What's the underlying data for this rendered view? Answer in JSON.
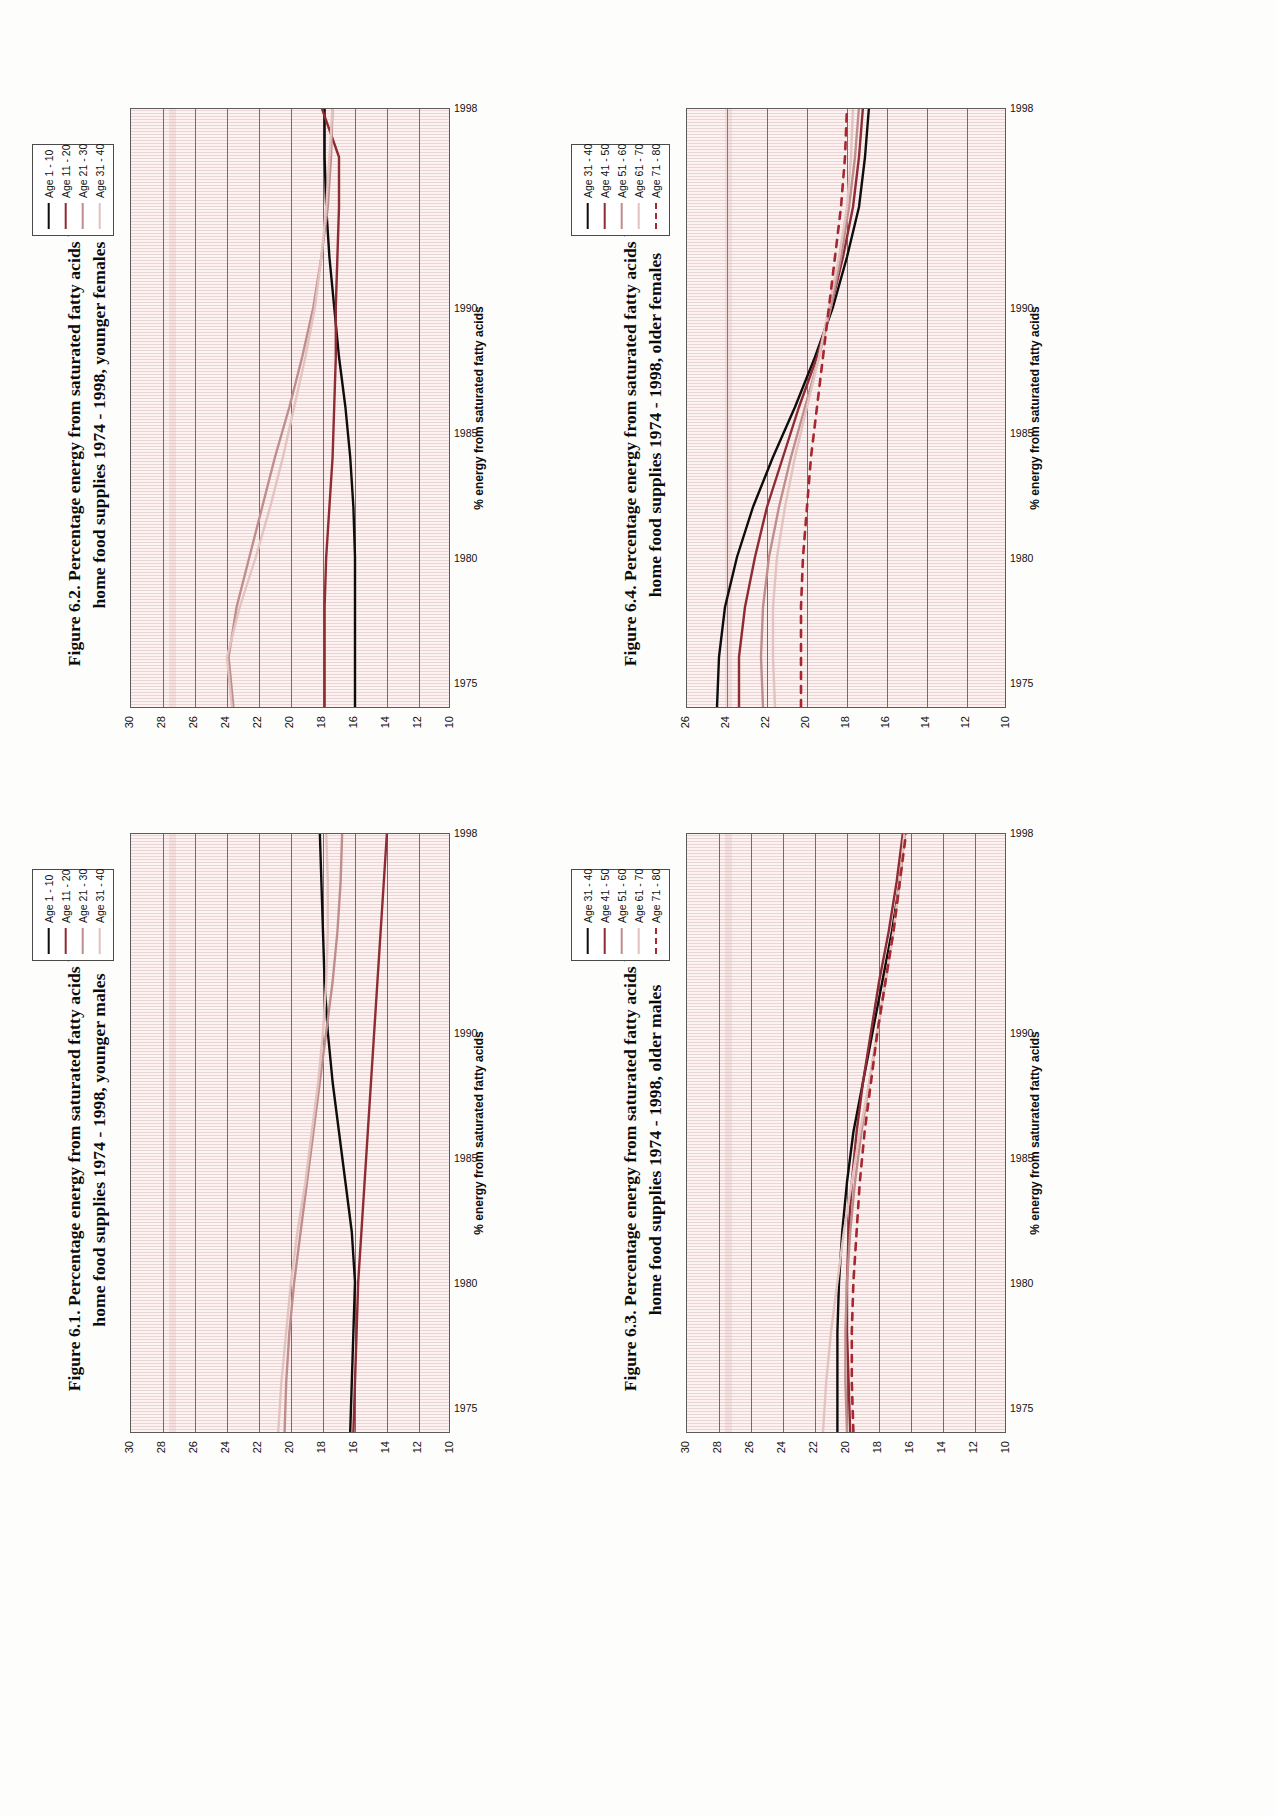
{
  "page": {
    "orientation": "landscape-rotated-90",
    "background": "#fdfdfc",
    "plot_background": "#fbf2f1"
  },
  "palette": {
    "series_1": "#0d0d0d",
    "series_2": "#8e2b33",
    "series_3": "#c08d8d",
    "series_4": "#e2c3c0",
    "series_5": "#a5272f",
    "gridline_major": "#6d6d6d",
    "gridline_minor": "#d4aaaa",
    "axis": "#5b5b5b"
  },
  "figures": [
    {
      "id": "figure-6-1",
      "title_line1": "Figure 6.1. Percentage energy from saturated fatty acids by  age,",
      "title_line2": "home food supplies 1974 - 1998, younger males",
      "chart_data": {
        "type": "line",
        "title": "Figure 6.1. Percentage energy from saturated fatty acids by age, home food supplies 1974 - 1998, younger males",
        "xlabel": "",
        "ylabel": "% energy from saturated fatty acids",
        "xlim": [
          1974,
          1998
        ],
        "ylim": [
          10,
          30
        ],
        "ytick_labels": [
          "30",
          "28",
          "26",
          "24",
          "22",
          "20",
          "18",
          "16",
          "14",
          "12",
          "10"
        ],
        "ytick_values": [
          30,
          28,
          26,
          24,
          22,
          20,
          18,
          16,
          14,
          12,
          10
        ],
        "xtick_labels": [
          "1975",
          "1980",
          "1985",
          "1990",
          "1998"
        ],
        "xtick_values": [
          1975,
          1980,
          1985,
          1990,
          1998
        ],
        "grid": true,
        "legend_position": "top-right",
        "x": [
          1974,
          1976,
          1978,
          1980,
          1982,
          1984,
          1986,
          1988,
          1990,
          1992,
          1994,
          1996,
          1998
        ],
        "series": [
          {
            "name": "Age 1 - 10",
            "color": "#0d0d0d",
            "style": "solid",
            "values": [
              16.3,
              16.2,
              16.1,
              16.0,
              16.2,
              16.6,
              17.0,
              17.4,
              17.7,
              17.9,
              18.0,
              18.1,
              18.2
            ]
          },
          {
            "name": "Age 11 - 20",
            "color": "#8e2b33",
            "style": "solid",
            "values": [
              16.1,
              16.0,
              15.9,
              15.8,
              15.6,
              15.4,
              15.2,
              15.0,
              14.8,
              14.6,
              14.4,
              14.2,
              14.0
            ]
          },
          {
            "name": "Age 21 - 30",
            "color": "#c08d8d",
            "style": "solid",
            "values": [
              20.4,
              20.3,
              20.1,
              19.8,
              19.4,
              19.0,
              18.6,
              18.2,
              17.8,
              17.4,
              17.1,
              16.9,
              16.8
            ]
          },
          {
            "name": "Age 31 - 40",
            "color": "#e2c3c0",
            "style": "solid",
            "values": [
              20.8,
              20.6,
              20.3,
              20.0,
              19.6,
              19.1,
              18.7,
              18.3,
              18.0,
              17.8,
              17.7,
              17.7,
              17.8
            ]
          }
        ]
      }
    },
    {
      "id": "figure-6-2",
      "title_line1": "Figure 6.2. Percentage energy from saturated fatty acids by  age,",
      "title_line2": "home food supplies 1974 - 1998, younger females",
      "chart_data": {
        "type": "line",
        "title": "Figure 6.2. Percentage energy from saturated fatty acids by age, home food supplies 1974 - 1998, younger females",
        "xlabel": "",
        "ylabel": "% energy from saturated fatty acids",
        "xlim": [
          1974,
          1998
        ],
        "ylim": [
          10,
          30
        ],
        "ytick_labels": [
          "30",
          "28",
          "26",
          "24",
          "22",
          "20",
          "18",
          "16",
          "14",
          "12",
          "10"
        ],
        "ytick_values": [
          30,
          28,
          26,
          24,
          22,
          20,
          18,
          16,
          14,
          12,
          10
        ],
        "xtick_labels": [
          "1975",
          "1980",
          "1985",
          "1990",
          "1998"
        ],
        "xtick_values": [
          1975,
          1980,
          1985,
          1990,
          1998
        ],
        "grid": true,
        "legend_position": "top-right",
        "x": [
          1974,
          1976,
          1978,
          1980,
          1982,
          1984,
          1986,
          1988,
          1990,
          1992,
          1994,
          1996,
          1998
        ],
        "series": [
          {
            "name": "Age 1 - 10",
            "color": "#0d0d0d",
            "style": "solid",
            "values": [
              16.0,
              16.0,
              16.0,
              16.0,
              16.1,
              16.3,
              16.6,
              17.0,
              17.3,
              17.6,
              17.8,
              17.9,
              17.9
            ]
          },
          {
            "name": "Age 11 - 20",
            "color": "#8e2b33",
            "style": "solid",
            "values": [
              17.9,
              17.9,
              17.9,
              17.8,
              17.6,
              17.4,
              17.3,
              17.2,
              17.2,
              17.1,
              17.0,
              17.0,
              18.1
            ]
          },
          {
            "name": "Age 21 - 30",
            "color": "#c08d8d",
            "style": "solid",
            "values": [
              23.6,
              23.9,
              23.4,
              22.6,
              21.8,
              21.0,
              20.1,
              19.3,
              18.6,
              18.1,
              17.7,
              17.5,
              17.4
            ]
          },
          {
            "name": "Age 31 - 40",
            "color": "#e2c3c0",
            "style": "solid",
            "values": [
              23.7,
              24.0,
              23.2,
              22.2,
              21.3,
              20.5,
              19.8,
              19.1,
              18.5,
              18.1,
              17.8,
              17.6,
              17.4
            ]
          }
        ]
      }
    },
    {
      "id": "figure-6-3",
      "title_line1": "Figure 6.3. Percentage energy from saturated fatty acids by age,",
      "title_line2": "home food supplies 1974 - 1998, older males",
      "chart_data": {
        "type": "line",
        "title": "Figure 6.3. Percentage energy from saturated fatty acids by age, home food supplies 1974 - 1998, older males",
        "xlabel": "",
        "ylabel": "% energy from saturated fatty acids",
        "xlim": [
          1974,
          1998
        ],
        "ylim": [
          10,
          30
        ],
        "ytick_labels": [
          "30",
          "28",
          "26",
          "24",
          "22",
          "20",
          "18",
          "16",
          "14",
          "12",
          "10"
        ],
        "ytick_values": [
          30,
          28,
          26,
          24,
          22,
          20,
          18,
          16,
          14,
          12,
          10
        ],
        "xtick_labels": [
          "1975",
          "1980",
          "1985",
          "1990",
          "1998"
        ],
        "xtick_values": [
          1975,
          1980,
          1985,
          1990,
          1998
        ],
        "grid": true,
        "legend_position": "top-right",
        "x": [
          1974,
          1976,
          1978,
          1980,
          1982,
          1984,
          1986,
          1988,
          1990,
          1992,
          1994,
          1996,
          1998
        ],
        "series": [
          {
            "name": "Age 31 - 40",
            "color": "#0d0d0d",
            "style": "solid",
            "values": [
              20.6,
              20.6,
              20.6,
              20.5,
              20.3,
              20.0,
              19.6,
              19.0,
              18.4,
              17.8,
              17.2,
              16.7,
              16.4
            ]
          },
          {
            "name": "Age 41 - 50",
            "color": "#8e2b33",
            "style": "solid",
            "values": [
              19.8,
              19.9,
              20.0,
              20.0,
              19.9,
              19.7,
              19.4,
              19.0,
              18.5,
              18.0,
              17.4,
              16.9,
              16.5
            ]
          },
          {
            "name": "Age 51 - 60",
            "color": "#c08d8d",
            "style": "solid",
            "values": [
              20.0,
              20.1,
              20.1,
              20.0,
              19.8,
              19.5,
              19.1,
              18.6,
              18.1,
              17.6,
              17.1,
              16.7,
              16.4
            ]
          },
          {
            "name": "Age 61 - 70",
            "color": "#e2c3c0",
            "style": "solid",
            "values": [
              21.5,
              21.3,
              21.0,
              20.6,
              20.2,
              19.7,
              19.2,
              18.6,
              18.1,
              17.6,
              17.1,
              16.7,
              16.4
            ]
          },
          {
            "name": "Age 71 - 80",
            "color": "#a5272f",
            "style": "dashed",
            "values": [
              19.6,
              19.7,
              19.7,
              19.6,
              19.4,
              19.2,
              18.9,
              18.5,
              18.1,
              17.6,
              17.1,
              16.7,
              16.3
            ]
          }
        ]
      }
    },
    {
      "id": "figure-6-4",
      "title_line1": "Figure 6.4. Percentage energy from saturated fatty acids by age,",
      "title_line2": "home food supplies 1974 - 1998, older females",
      "chart_data": {
        "type": "line",
        "title": "Figure 6.4. Percentage energy from saturated fatty acids by age, home food supplies 1974 - 1998, older females",
        "xlabel": "",
        "ylabel": "% energy from saturated fatty acids",
        "xlim": [
          1974,
          1998
        ],
        "ylim": [
          10,
          26
        ],
        "ytick_labels": [
          "26",
          "24",
          "22",
          "20",
          "18",
          "16",
          "14",
          "12",
          "10"
        ],
        "ytick_values": [
          26,
          24,
          22,
          20,
          18,
          16,
          14,
          12,
          10
        ],
        "xtick_labels": [
          "1975",
          "1980",
          "1985",
          "1990",
          "1998"
        ],
        "xtick_values": [
          1975,
          1980,
          1985,
          1990,
          1998
        ],
        "grid": true,
        "legend_position": "top-right",
        "x": [
          1974,
          1976,
          1978,
          1980,
          1982,
          1984,
          1986,
          1988,
          1990,
          1992,
          1994,
          1996,
          1998
        ],
        "series": [
          {
            "name": "Age 31 - 40",
            "color": "#0d0d0d",
            "style": "solid",
            "values": [
              24.5,
              24.4,
              24.1,
              23.5,
              22.7,
              21.7,
              20.6,
              19.6,
              18.7,
              18.0,
              17.4,
              17.1,
              16.9
            ]
          },
          {
            "name": "Age 41 - 50",
            "color": "#8e2b33",
            "style": "solid",
            "values": [
              23.4,
              23.4,
              23.1,
              22.6,
              22.0,
              21.2,
              20.4,
              19.5,
              18.8,
              18.2,
              17.7,
              17.4,
              17.2
            ]
          },
          {
            "name": "Age 51 - 60",
            "color": "#c08d8d",
            "style": "solid",
            "values": [
              22.2,
              22.3,
              22.2,
              21.9,
              21.4,
              20.8,
              20.1,
              19.4,
              18.8,
              18.3,
              17.9,
              17.6,
              17.4
            ]
          },
          {
            "name": "Age 61 - 70",
            "color": "#e2c3c0",
            "style": "solid",
            "values": [
              21.6,
              21.7,
              21.7,
              21.5,
              21.1,
              20.6,
              20.0,
              19.4,
              18.9,
              18.4,
              18.0,
              17.8,
              17.7
            ]
          },
          {
            "name": "Age 71 - 80",
            "color": "#a5272f",
            "style": "dashed",
            "values": [
              20.3,
              20.3,
              20.3,
              20.2,
              20.0,
              19.8,
              19.5,
              19.2,
              18.9,
              18.6,
              18.3,
              18.1,
              18.0
            ]
          }
        ]
      }
    }
  ]
}
